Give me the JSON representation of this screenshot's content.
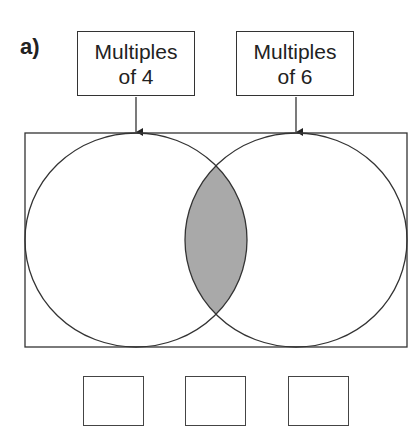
{
  "question": {
    "part_label": "a)",
    "sets": [
      {
        "line1": "Multiples",
        "line2": "of 4"
      },
      {
        "line1": "Multiples",
        "line2": "of 6"
      }
    ],
    "shaded_region": "intersection",
    "shade_color": "#a9a9a9",
    "answer_boxes": [
      "",
      "",
      ""
    ]
  }
}
